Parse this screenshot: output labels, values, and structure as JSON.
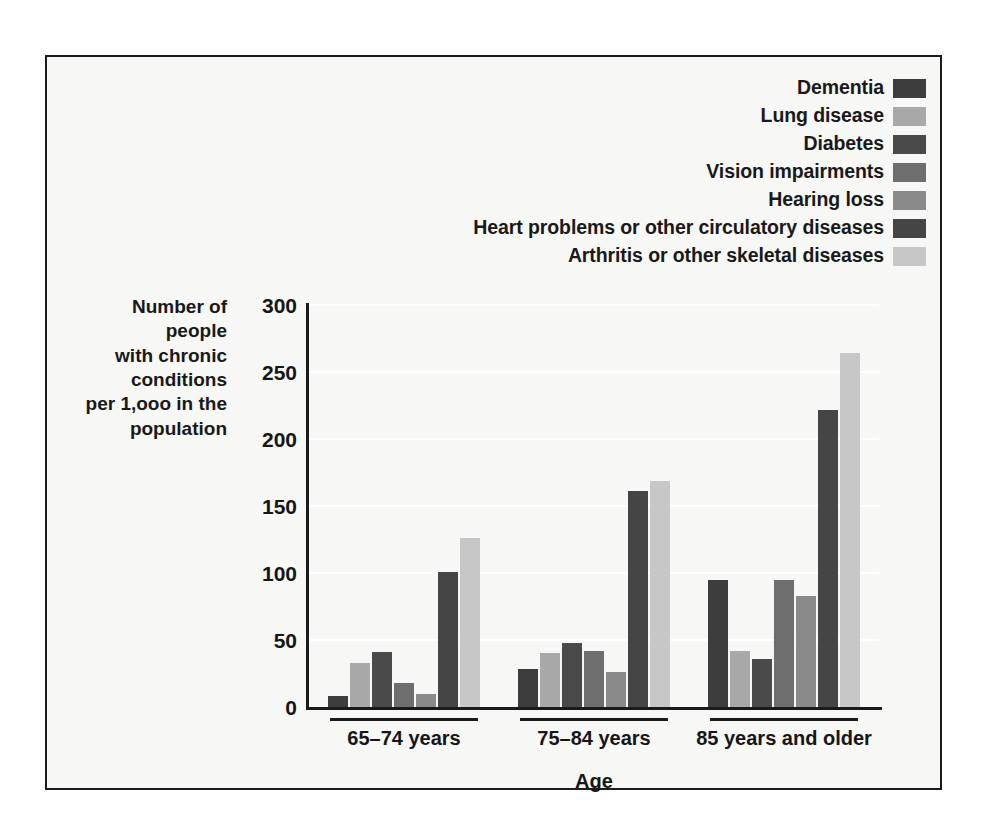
{
  "figure": {
    "background_color": "#f7f7f5",
    "frame_color": "#1b1b1b",
    "text_color": "#191919"
  },
  "chart_data": {
    "type": "bar",
    "title": "",
    "subtitle": "",
    "xlabel": "Age",
    "ylabel": "Number of people with chronic conditions per 1,000 in the population",
    "ylabel_lines": [
      "Number of people",
      "with chronic conditions",
      "per 1,ooo in the",
      "population"
    ],
    "categories": [
      "65–74 years",
      "75–84 years",
      "85 years and older"
    ],
    "ylim": [
      0,
      300
    ],
    "yticks": [
      0,
      50,
      100,
      150,
      200,
      250,
      300
    ],
    "ytick_labels": [
      "0",
      "50",
      "100",
      "150",
      "200",
      "250",
      "300"
    ],
    "grid": true,
    "grid_color": "#ffffff",
    "legend_position": "top-right",
    "bar_orientation": "vertical",
    "series": [
      {
        "name": "Dementia",
        "color": "#3d3d3d",
        "values": [
          8,
          28,
          95
        ]
      },
      {
        "name": "Lung disease",
        "color": "#a8a8a8",
        "values": [
          33,
          40,
          42
        ]
      },
      {
        "name": "Diabetes",
        "color": "#4a4a4a",
        "values": [
          41,
          48,
          36
        ]
      },
      {
        "name": "Vision impairments",
        "color": "#6e6e6e",
        "values": [
          18,
          42,
          95
        ]
      },
      {
        "name": "Hearing loss",
        "color": "#8a8a8a",
        "values": [
          10,
          26,
          83
        ]
      },
      {
        "name": "Heart problems or other circulatory diseases",
        "color": "#454545",
        "values": [
          101,
          161,
          222
        ]
      },
      {
        "name": "Arthritis or other skeletal diseases",
        "color": "#c7c7c7",
        "values": [
          126,
          169,
          264
        ]
      }
    ]
  }
}
